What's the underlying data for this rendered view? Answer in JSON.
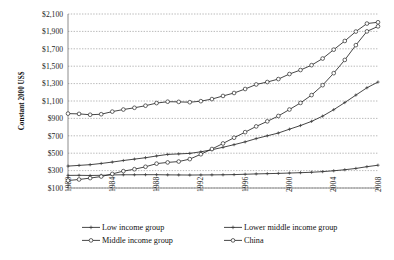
{
  "chart_data": {
    "type": "line",
    "title": "",
    "xlabel": "",
    "ylabel": "Constant 2000 US$",
    "ylim": [
      100,
      2100
    ],
    "ytick_labels": [
      "$2,100",
      "$1,900",
      "$1,700",
      "$1,500",
      "$1,300",
      "$1,100",
      "$900",
      "$700",
      "$500",
      "$300",
      "$100"
    ],
    "ytick_values": [
      2100,
      1900,
      1700,
      1500,
      1300,
      1100,
      900,
      700,
      500,
      300,
      100
    ],
    "xlim": [
      1980,
      2008
    ],
    "xtick_labels": [
      "1980",
      "1984",
      "1988",
      "1992",
      "1996",
      "2000",
      "2004",
      "2008"
    ],
    "xtick_values": [
      1980,
      1984,
      1988,
      1992,
      1996,
      2000,
      2004,
      2008
    ],
    "x": [
      1980,
      1981,
      1982,
      1983,
      1984,
      1985,
      1986,
      1987,
      1988,
      1989,
      1990,
      1991,
      1992,
      1993,
      1994,
      1995,
      1996,
      1997,
      1998,
      1999,
      2000,
      2001,
      2002,
      2003,
      2004,
      2005,
      2006,
      2007,
      2008
    ],
    "grid": true,
    "legend_position": "bottom",
    "series": [
      {
        "name": "Low income group",
        "marker": "cross",
        "values": [
          245,
          246,
          244,
          246,
          250,
          252,
          252,
          253,
          253,
          251,
          250,
          249,
          250,
          251,
          252,
          254,
          258,
          262,
          265,
          268,
          272,
          276,
          281,
          288,
          298,
          310,
          325,
          345,
          362
        ]
      },
      {
        "name": "Lower middle income group",
        "marker": "cross",
        "values": [
          352,
          360,
          368,
          382,
          398,
          416,
          432,
          448,
          468,
          486,
          492,
          498,
          516,
          540,
          568,
          598,
          630,
          668,
          700,
          732,
          776,
          818,
          866,
          926,
          1000,
          1082,
          1168,
          1252,
          1318
        ]
      },
      {
        "name": "Middle income group",
        "marker": "open-circle",
        "values": [
          955,
          952,
          942,
          948,
          978,
          1002,
          1022,
          1046,
          1076,
          1092,
          1090,
          1086,
          1098,
          1122,
          1158,
          1192,
          1238,
          1290,
          1318,
          1352,
          1410,
          1456,
          1512,
          1588,
          1690,
          1790,
          1898,
          1990,
          2005
        ]
      },
      {
        "name": "China",
        "marker": "open-circle",
        "values": [
          186,
          198,
          214,
          232,
          262,
          294,
          316,
          344,
          380,
          394,
          404,
          432,
          488,
          548,
          612,
          678,
          742,
          808,
          866,
          928,
          1002,
          1078,
          1168,
          1282,
          1420,
          1572,
          1742,
          1900,
          1958
        ]
      }
    ]
  },
  "legend": {
    "items": [
      {
        "label": "Low income group",
        "marker": "cross"
      },
      {
        "label": "Lower middle income group",
        "marker": "cross"
      },
      {
        "label": "Middle income group",
        "marker": "open-circle"
      },
      {
        "label": "China",
        "marker": "open-circle"
      }
    ]
  }
}
